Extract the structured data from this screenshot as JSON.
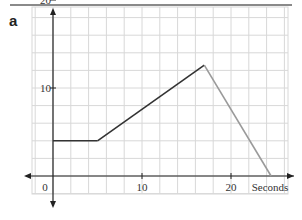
{
  "panel_label": "a",
  "chart_data": {
    "type": "line",
    "title": "",
    "xlabel": "Seconds",
    "ylabel": "",
    "xlim": [
      -2.5,
      26
    ],
    "ylim": [
      -2,
      21
    ],
    "grid": true,
    "grid_step": 2,
    "x_ticks": [
      0,
      10,
      20
    ],
    "x_tick_labels": [
      "0",
      "10",
      "20"
    ],
    "y_ticks": [
      10,
      20
    ],
    "y_tick_labels": [
      "10",
      "20"
    ],
    "series": [
      {
        "name": "segment-1-flat",
        "color": "#333333",
        "x": [
          0,
          5
        ],
        "y": [
          4,
          4
        ]
      },
      {
        "name": "segment-2-rising",
        "color": "#333333",
        "x": [
          5,
          17
        ],
        "y": [
          4,
          12.6
        ]
      },
      {
        "name": "segment-3-falling",
        "color": "#9a9a9a",
        "x": [
          17,
          24.5
        ],
        "y": [
          12.6,
          0
        ]
      }
    ]
  }
}
